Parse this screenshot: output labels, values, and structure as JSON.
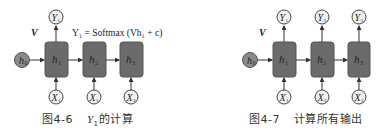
{
  "figures": [
    {
      "id": "fig-4-6",
      "caption": {
        "number": "图4-6",
        "text_math": "Y",
        "text_sub": "1",
        "text_rest": "的计算"
      },
      "weight_label": "V",
      "formula": "Y₁ = Softmax (Vh₁ + c)",
      "initial_state": {
        "label": "h",
        "sub": "0"
      },
      "hidden": [
        {
          "label": "h",
          "sub": "1"
        },
        {
          "label": "h",
          "sub": "2"
        },
        {
          "label": "h",
          "sub": "3"
        }
      ],
      "inputs": [
        {
          "label": "X",
          "sub": "1"
        },
        {
          "label": "X",
          "sub": "2"
        },
        {
          "label": "X",
          "sub": "3"
        }
      ],
      "outputs": [
        {
          "label": "Y",
          "sub": "1"
        }
      ]
    },
    {
      "id": "fig-4-7",
      "caption": {
        "number": "图4-7",
        "text": "计算所有输出"
      },
      "weight_label": "V",
      "initial_state": {
        "label": "h",
        "sub": "0"
      },
      "hidden": [
        {
          "label": "h",
          "sub": "1"
        },
        {
          "label": "h",
          "sub": "2"
        },
        {
          "label": "h",
          "sub": "3"
        }
      ],
      "inputs": [
        {
          "label": "X",
          "sub": "1"
        },
        {
          "label": "X",
          "sub": "2"
        },
        {
          "label": "X",
          "sub": "3"
        }
      ],
      "outputs": [
        {
          "label": "Y",
          "sub": "1"
        },
        {
          "label": "Y",
          "sub": "2"
        },
        {
          "label": "Y",
          "sub": "3"
        }
      ]
    }
  ],
  "colors": {
    "box_fill": "#6b6b6b",
    "box_stroke": "#555555",
    "h0_fill": "#8a8a8a",
    "circle_fill": "#f2f2f2",
    "stroke": "#444444",
    "text": "#333333"
  }
}
